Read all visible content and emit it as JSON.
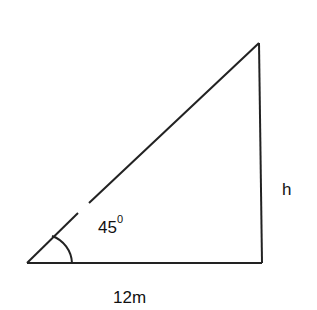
{
  "diagram": {
    "type": "right-triangle",
    "angle_label": {
      "value": "45",
      "unit_sup": "0"
    },
    "height_label": "h",
    "base_label": "12m",
    "colors": {
      "stroke": "#222222",
      "background": "#ffffff"
    }
  }
}
